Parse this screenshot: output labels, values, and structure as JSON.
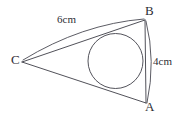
{
  "figure": {
    "kind": "geometry-diagram",
    "background_color": "#ffffff",
    "stroke_color": "#3d3d46",
    "text_color": "#2e2e35",
    "vertices": [
      {
        "id": "B",
        "label": "B",
        "x": 145,
        "y": 20
      },
      {
        "id": "A",
        "label": "A",
        "x": 146,
        "y": 103
      },
      {
        "id": "C",
        "label": "C",
        "x": 22,
        "y": 62
      }
    ],
    "sides": [
      {
        "id": "CB",
        "from": "C",
        "to": "B",
        "measure_label": "6cm"
      },
      {
        "id": "BA",
        "from": "B",
        "to": "A",
        "measure_label": "4cm"
      },
      {
        "id": "CA",
        "from": "C",
        "to": "A",
        "measure_label": ""
      }
    ],
    "incircle": {
      "center_x": 115.5,
      "center_y": 61,
      "radius": 27.5
    },
    "labels": {
      "vertex_b": "B",
      "vertex_a": "A",
      "vertex_c": "C",
      "side_cb": "6cm",
      "side_ba": "4cm"
    }
  }
}
